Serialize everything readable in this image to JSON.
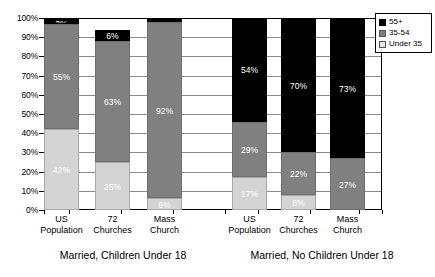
{
  "chart_data": {
    "type": "bar",
    "subtype": "100-percent-stacked-column",
    "title": "",
    "xlabel": "",
    "ylabel": "",
    "ylim": [
      0,
      100
    ],
    "ytick_labels": [
      "0%",
      "10%",
      "20%",
      "30%",
      "40%",
      "50%",
      "60%",
      "70%",
      "80%",
      "90%",
      "100%"
    ],
    "ytick_values": [
      0,
      10,
      20,
      30,
      40,
      50,
      60,
      70,
      80,
      90,
      100
    ],
    "grid": true,
    "legend_position": "right-top",
    "legend": [
      "55+",
      "35-54",
      "Under 35"
    ],
    "colors": {
      "55+": "#000000",
      "35-54": "#808080",
      "Under 35": "#d4d4d4"
    },
    "categories": [
      "US Population",
      "72 Churches",
      "Mass Church",
      "US Population",
      "72 Churches",
      "Mass Church"
    ],
    "groups": [
      {
        "label": "Married, Children Under 18",
        "categories": [
          "US Population",
          "72 Churches",
          "Mass Church"
        ]
      },
      {
        "label": "Married, No Children Under 18",
        "categories": [
          "US Population",
          "72 Churches",
          "Mass Church"
        ]
      }
    ],
    "series": [
      {
        "name": "Under 35",
        "values": [
          42,
          25,
          6,
          17,
          8,
          0
        ]
      },
      {
        "name": "35-54",
        "values": [
          55,
          63,
          92,
          29,
          22,
          27
        ]
      },
      {
        "name": "55+",
        "values": [
          3,
          6,
          2,
          54,
          70,
          73
        ]
      }
    ],
    "bars": [
      {
        "group": 0,
        "category": "US Population",
        "category_line1": "US",
        "category_line2": "Population",
        "segments": [
          {
            "series": "Under 35",
            "value": 42,
            "label": "42%"
          },
          {
            "series": "35-54",
            "value": 55,
            "label": "55%"
          },
          {
            "series": "55+",
            "value": 3,
            "label": "3%"
          }
        ]
      },
      {
        "group": 0,
        "category": "72 Churches",
        "category_line1": "72",
        "category_line2": "Churches",
        "segments": [
          {
            "series": "Under 35",
            "value": 25,
            "label": "25%"
          },
          {
            "series": "35-54",
            "value": 63,
            "label": "63%"
          },
          {
            "series": "55+",
            "value": 6,
            "label": "6%"
          }
        ]
      },
      {
        "group": 0,
        "category": "Mass Church",
        "category_line1": "Mass",
        "category_line2": "Church",
        "segments": [
          {
            "series": "Under 35",
            "value": 6,
            "label": "6%"
          },
          {
            "series": "35-54",
            "value": 92,
            "label": "92%"
          },
          {
            "series": "55+",
            "value": 2,
            "label": "2%"
          }
        ]
      },
      {
        "group": 1,
        "category": "US Population",
        "category_line1": "US",
        "category_line2": "Population",
        "segments": [
          {
            "series": "Under 35",
            "value": 17,
            "label": "17%"
          },
          {
            "series": "35-54",
            "value": 29,
            "label": "29%"
          },
          {
            "series": "55+",
            "value": 54,
            "label": "54%"
          }
        ]
      },
      {
        "group": 1,
        "category": "72 Churches",
        "category_line1": "72",
        "category_line2": "Churches",
        "segments": [
          {
            "series": "Under 35",
            "value": 8,
            "label": "8%"
          },
          {
            "series": "35-54",
            "value": 22,
            "label": "22%"
          },
          {
            "series": "55+",
            "value": 70,
            "label": "70%"
          }
        ]
      },
      {
        "group": 1,
        "category": "Mass Church",
        "category_line1": "Mass",
        "category_line2": "Church",
        "segments": [
          {
            "series": "Under 35",
            "value": 0,
            "label": "0%"
          },
          {
            "series": "35-54",
            "value": 27,
            "label": "27%"
          },
          {
            "series": "55+",
            "value": 73,
            "label": "73%"
          }
        ]
      }
    ]
  }
}
